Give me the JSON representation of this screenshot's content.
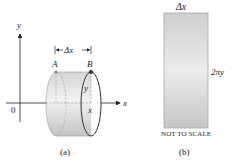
{
  "panel_a": {
    "caption": "(a)",
    "axes": {
      "x_label": "x",
      "y_label": "y",
      "origin_label": "0"
    },
    "points": {
      "A": "A",
      "B": "B"
    },
    "delta_label": "Δx",
    "radius_label": "y",
    "position_label": "x"
  },
  "panel_b": {
    "caption": "(b)",
    "width_label": "Δx",
    "height_label": "2πy",
    "note": "NOT TO SCALE"
  },
  "colors": {
    "ink": "#222222",
    "surface_light": "#ececec",
    "surface_mid": "#d4d4d4",
    "surface_dark": "#bdbdbd",
    "rect_border": "#a8a8a8"
  }
}
